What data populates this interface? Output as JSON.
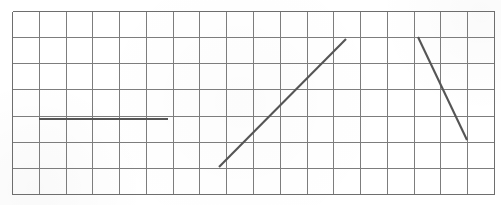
{
  "figure": {
    "background_color": "#ffffff",
    "width": 501,
    "height": 205
  },
  "grid": {
    "name": "graph-paper-grid",
    "columns": 18,
    "rows": 7,
    "x0": 12,
    "y0": 11,
    "x1": 494,
    "y1": 194,
    "cell_width": 26.78,
    "cell_height": 26.14,
    "line_color": "#7d7d7d",
    "line_width": 1,
    "border_color": "#6e6e6e",
    "border_width": 1.4
  },
  "chart_data": {
    "type": "line",
    "xlabel": "",
    "ylabel": "",
    "grid": true,
    "legend": "none",
    "xlim": [
      0,
      18
    ],
    "ylim": [
      0,
      7
    ],
    "segments": [
      {
        "name": "horizontal-segment",
        "label": "Zero-slope segment",
        "color": "#555555",
        "width": 2.1,
        "points_px": [
          [
            39,
            119
          ],
          [
            168,
            119
          ]
        ],
        "points_grid": [
          [
            1.0,
            4.0
          ],
          [
            5.82,
            4.0
          ]
        ],
        "slope": 0
      },
      {
        "name": "rising-diagonal-segment",
        "label": "Positive-slope segment",
        "color": "#555555",
        "width": 2.1,
        "points_px": [
          [
            219,
            167
          ],
          [
            346,
            39
          ]
        ],
        "points_grid": [
          [
            7.73,
            1.03
          ],
          [
            12.47,
            5.93
          ]
        ],
        "slope": 1.03
      },
      {
        "name": "falling-diagonal-segment",
        "label": "Negative-slope segment",
        "color": "#555555",
        "width": 2.1,
        "points_px": [
          [
            418,
            37
          ],
          [
            467,
            140
          ]
        ],
        "points_grid": [
          [
            15.16,
            6.01
          ],
          [
            16.99,
            2.07
          ]
        ],
        "slope": -2.15
      }
    ]
  }
}
